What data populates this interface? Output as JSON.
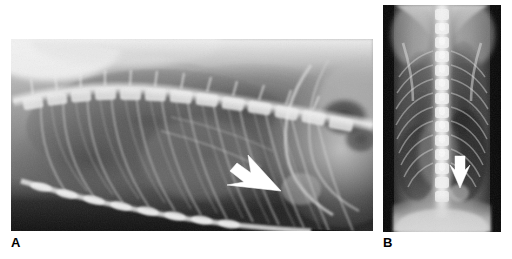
{
  "figure": {
    "type": "radiograph-figure",
    "background_color": "#ffffff",
    "panel_count": 2,
    "modality": "Radiography (plain film X-ray)",
    "body_region": "Thorax",
    "panels": [
      {
        "id": "A",
        "label": "A",
        "view": "Lateral thoracic radiograph",
        "position": {
          "x": 11,
          "y": 39,
          "width": 362,
          "height": 192
        },
        "label_position": {
          "x": 11,
          "y": 236
        },
        "annotation": {
          "type": "arrow",
          "color": "#ffffff",
          "direction": "down-right",
          "tail": {
            "x": 243,
            "y": 157
          },
          "tip": {
            "x": 281,
            "y": 191
          },
          "description": "White arrow indicating a focal caudodorsal pulmonary lesion"
        },
        "visible_structures": [
          "thoracic vertebral column",
          "rib cage",
          "sternum",
          "diaphragm",
          "cardiac silhouette",
          "gas-filled stomach",
          "pulmonary parenchyma"
        ],
        "tone": {
          "lung_field": "#6f6f6f",
          "soft_tissue": "#9a9a9a",
          "bone": "#d8d8d8",
          "background_air": "#161616"
        }
      },
      {
        "id": "B",
        "label": "B",
        "view": "Ventrodorsal thoracic radiograph",
        "position": {
          "x": 383,
          "y": 5,
          "width": 118,
          "height": 227
        },
        "label_position": {
          "x": 383,
          "y": 236
        },
        "annotation": {
          "type": "arrow",
          "color": "#ffffff",
          "direction": "down",
          "tail": {
            "x": 460,
            "y": 156
          },
          "tip": {
            "x": 460,
            "y": 188
          },
          "description": "White arrow indicating the same lesion in orthogonal projection"
        },
        "visible_structures": [
          "thoracic vertebral column (midline)",
          "rib cage (bilateral)",
          "scapulae",
          "cardiac silhouette",
          "diaphragm",
          "pulmonary parenchyma"
        ],
        "tone": {
          "lung_field": "#4c4c4c",
          "soft_tissue": "#b0b0b0",
          "bone": "#e2e2e2",
          "background_air": "#0d0d0d"
        }
      }
    ]
  }
}
